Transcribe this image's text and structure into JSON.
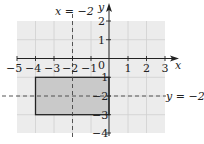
{
  "diagram": {
    "type": "coordinate-plane",
    "x_axis": {
      "label": "x",
      "ticks": [
        "-5",
        "-4",
        "-3",
        "-2",
        "-1",
        "0",
        "1",
        "2",
        "3"
      ],
      "range": [
        -5,
        3
      ]
    },
    "y_axis": {
      "label": "y",
      "ticks": [
        "2",
        "1",
        "-1",
        "-2",
        "-3",
        "-4"
      ],
      "range": [
        -4,
        2
      ]
    },
    "shaded_rectangle": {
      "x_min": -4,
      "x_max": 0,
      "y_min": -3,
      "y_max": -1
    },
    "lines": [
      {
        "label": "x = -2",
        "style": "dashed",
        "orientation": "vertical"
      },
      {
        "label": "y = -2",
        "style": "dashed",
        "orientation": "horizontal"
      }
    ],
    "colors": {
      "grid_bg": "#ececec",
      "grid_line": "#d0d0d0",
      "rect_fill": "#c9c9c9",
      "ink": "#222222"
    }
  },
  "labels": {
    "x_axis": "x",
    "y_axis": "y",
    "vline": "x = −2",
    "hline": "y = −2",
    "x_ticks": [
      "−5",
      "−4",
      "−3",
      "−2",
      "−1",
      "0",
      "1",
      "2",
      "3"
    ],
    "y_ticks": {
      "p2": "2",
      "p1": "1",
      "m1": "−1",
      "m2": "−2",
      "m3": "−3",
      "m4": "−4"
    }
  }
}
